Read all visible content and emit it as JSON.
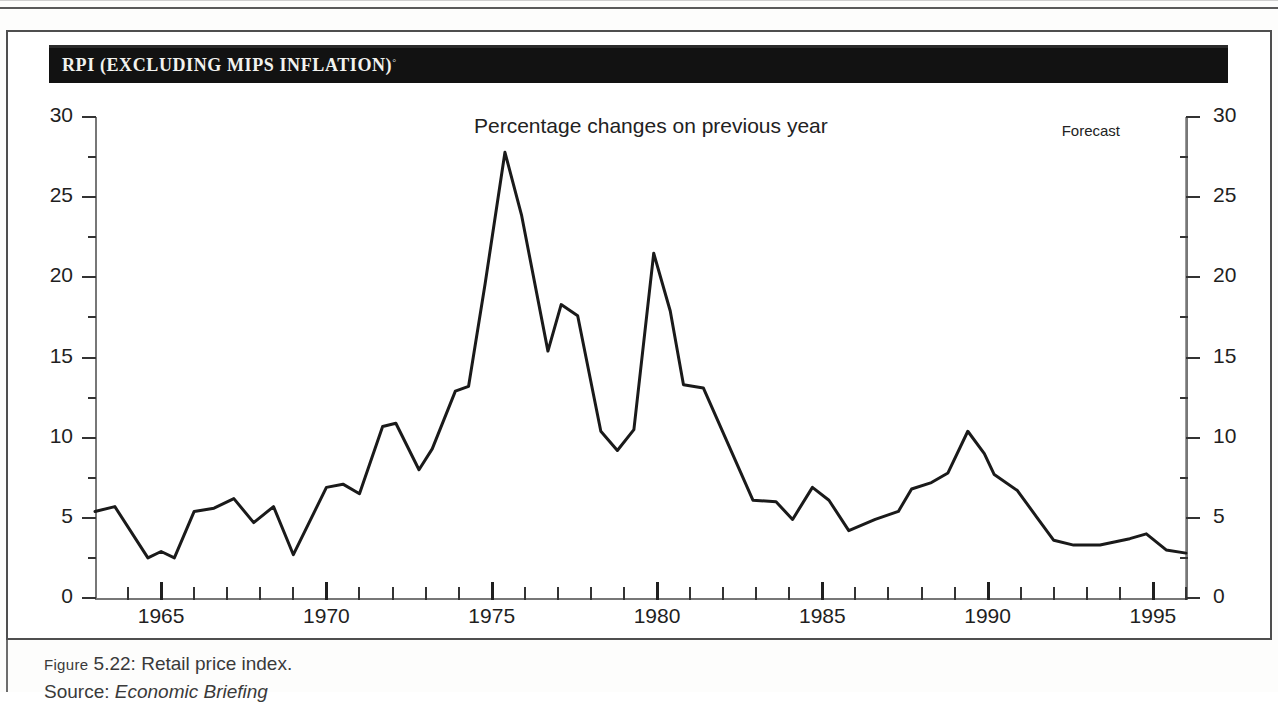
{
  "figure": {
    "banner_title": "RPI (EXCLUDING MIPS INFLATION)",
    "banner_title_marker": "◦",
    "subtitle": "Percentage changes on previous year",
    "forecast_label": "Forecast",
    "caption_label": "Figure",
    "caption_number": "5.22:",
    "caption_text": "Retail price index.",
    "source_label": "Source:",
    "source_name": "Economic Briefing"
  },
  "colors": {
    "banner_background": "#121212",
    "banner_text": "#f2f2ef",
    "line": "#1a1a1a",
    "axis": "#777777",
    "frame": "#4f4f4f",
    "page_background": "#ffffff"
  },
  "chart_data": {
    "type": "line",
    "title": "RPI (EXCLUDING MIPS INFLATION)",
    "subtitle": "Percentage changes on previous year",
    "xlabel": "",
    "ylabel": "",
    "ylim": [
      0,
      30
    ],
    "xlim": [
      1963,
      1996
    ],
    "grid": false,
    "legend": "none",
    "y_ticks_major": [
      0,
      5,
      10,
      15,
      20,
      25,
      30
    ],
    "y_ticks_minor": [
      2.5,
      7.5,
      12.5,
      17.5,
      22.5,
      27.5
    ],
    "y_tick_labels": [
      "0",
      "5",
      "10",
      "15",
      "20",
      "25",
      "30"
    ],
    "x_ticks_major": [
      1965,
      1970,
      1975,
      1980,
      1985,
      1990,
      1995
    ],
    "x_tick_labels": [
      "1965",
      "1970",
      "1975",
      "1980",
      "1985",
      "1990",
      "1995"
    ],
    "x_ticks_minor": [
      1964,
      1966,
      1967,
      1968,
      1969,
      1971,
      1972,
      1973,
      1974,
      1976,
      1977,
      1978,
      1979,
      1981,
      1982,
      1983,
      1984,
      1986,
      1987,
      1988,
      1989,
      1991,
      1992,
      1993,
      1994,
      1996
    ],
    "annotations": [
      {
        "text": "Forecast",
        "x": 1995.3,
        "y": 29.0
      }
    ],
    "series": [
      {
        "name": "RPI excluding MIPS",
        "x": [
          1963,
          1964,
          1965,
          1966,
          1967,
          1968,
          1969,
          1970,
          1971,
          1972,
          1973,
          1974,
          1975,
          1976,
          1977,
          1978,
          1979,
          1980,
          1981,
          1982,
          1983,
          1984,
          1985,
          1986,
          1987,
          1988,
          1989,
          1990,
          1991,
          1992,
          1993,
          1994,
          1995,
          1996
        ],
        "values": [
          5.4,
          2.5,
          3.0,
          5.4,
          4.7,
          5.6,
          2.7,
          6.9,
          7.1,
          6.5,
          10.9,
          9.3,
          27.8,
          24.0,
          18.3,
          9.2,
          21.5,
          13.3,
          6.1,
          5.0,
          6.9,
          4.2,
          6.6,
          10.4,
          7.7,
          4.0,
          3.3,
          3.5,
          4.0,
          2.8,
          3.2,
          3.0,
          2.9,
          2.8
        ]
      }
    ],
    "vertices": [
      {
        "year": 1963.0,
        "value": 5.4
      },
      {
        "year": 1963.6,
        "value": 5.7
      },
      {
        "year": 1964.6,
        "value": 2.5
      },
      {
        "year": 1965.0,
        "value": 2.9
      },
      {
        "year": 1965.4,
        "value": 2.5
      },
      {
        "year": 1966.0,
        "value": 5.4
      },
      {
        "year": 1966.6,
        "value": 5.6
      },
      {
        "year": 1967.2,
        "value": 6.2
      },
      {
        "year": 1967.8,
        "value": 4.7
      },
      {
        "year": 1968.4,
        "value": 5.7
      },
      {
        "year": 1969.0,
        "value": 2.7
      },
      {
        "year": 1970.0,
        "value": 6.9
      },
      {
        "year": 1970.5,
        "value": 7.1
      },
      {
        "year": 1971.0,
        "value": 6.5
      },
      {
        "year": 1971.7,
        "value": 10.7
      },
      {
        "year": 1972.1,
        "value": 10.9
      },
      {
        "year": 1972.8,
        "value": 8.0
      },
      {
        "year": 1973.2,
        "value": 9.3
      },
      {
        "year": 1973.9,
        "value": 12.9
      },
      {
        "year": 1974.3,
        "value": 13.2
      },
      {
        "year": 1974.8,
        "value": 19.6
      },
      {
        "year": 1975.4,
        "value": 27.8
      },
      {
        "year": 1975.9,
        "value": 23.9
      },
      {
        "year": 1976.7,
        "value": 15.4
      },
      {
        "year": 1977.1,
        "value": 18.3
      },
      {
        "year": 1977.6,
        "value": 17.6
      },
      {
        "year": 1978.3,
        "value": 10.4
      },
      {
        "year": 1978.8,
        "value": 9.2
      },
      {
        "year": 1979.3,
        "value": 10.5
      },
      {
        "year": 1979.9,
        "value": 21.5
      },
      {
        "year": 1980.4,
        "value": 17.9
      },
      {
        "year": 1980.8,
        "value": 13.3
      },
      {
        "year": 1981.4,
        "value": 13.1
      },
      {
        "year": 1982.9,
        "value": 6.1
      },
      {
        "year": 1983.6,
        "value": 6.0
      },
      {
        "year": 1984.1,
        "value": 4.9
      },
      {
        "year": 1984.7,
        "value": 6.9
      },
      {
        "year": 1985.2,
        "value": 6.1
      },
      {
        "year": 1985.8,
        "value": 4.2
      },
      {
        "year": 1986.6,
        "value": 4.9
      },
      {
        "year": 1987.3,
        "value": 5.4
      },
      {
        "year": 1987.7,
        "value": 6.8
      },
      {
        "year": 1988.3,
        "value": 7.2
      },
      {
        "year": 1988.8,
        "value": 7.8
      },
      {
        "year": 1989.4,
        "value": 10.4
      },
      {
        "year": 1989.9,
        "value": 9.0
      },
      {
        "year": 1990.2,
        "value": 7.7
      },
      {
        "year": 1990.9,
        "value": 6.7
      },
      {
        "year": 1991.5,
        "value": 5.0
      },
      {
        "year": 1992.0,
        "value": 3.6
      },
      {
        "year": 1992.6,
        "value": 3.3
      },
      {
        "year": 1993.4,
        "value": 3.3
      },
      {
        "year": 1994.3,
        "value": 3.7
      },
      {
        "year": 1994.8,
        "value": 4.0
      },
      {
        "year": 1995.4,
        "value": 3.0
      },
      {
        "year": 1996.0,
        "value": 2.8
      }
    ]
  }
}
